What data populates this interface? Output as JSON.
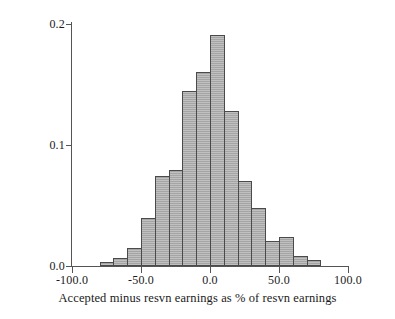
{
  "chart_data": {
    "type": "bar",
    "title": "",
    "subtitle": "",
    "xlabel": "Accepted minus resvn earnings as % of resvn earnings",
    "ylabel": "Fraction",
    "xlim": [
      -100.0,
      100.0
    ],
    "ylim": [
      0.0,
      0.2
    ],
    "grid": false,
    "legend": null,
    "bin_width": 10,
    "x_tick_labels": [
      "-100.0",
      "-50.0",
      "0.0",
      "50.0",
      "100.0"
    ],
    "x_tick_values": [
      -100.0,
      -50.0,
      0.0,
      50.0,
      100.0
    ],
    "y_tick_labels": [
      "0.0",
      "0.1",
      "0.2"
    ],
    "y_tick_values": [
      0.0,
      0.1,
      0.2
    ],
    "bar_fill_color": "#a5a5a5",
    "bar_edge_color": "#4a4a4a",
    "axis_color": "#555555",
    "background_color": "#ffffff",
    "bin_left_edges": [
      -80,
      -70,
      -60,
      -50,
      -40,
      -30,
      -20,
      -10,
      0,
      10,
      20,
      30,
      40,
      50,
      60,
      70
    ],
    "bin_centers": [
      -75,
      -65,
      -55,
      -45,
      -35,
      -25,
      -15,
      -5,
      5,
      15,
      25,
      35,
      45,
      55,
      65,
      75
    ],
    "categories": [
      "-80 to -70",
      "-70 to -60",
      "-60 to -50",
      "-50 to -40",
      "-40 to -30",
      "-30 to -20",
      "-20 to -10",
      "-10 to 0",
      "0 to 10",
      "10 to 20",
      "20 to 30",
      "30 to 40",
      "40 to 50",
      "50 to 60",
      "60 to 70",
      "70 to 80"
    ],
    "values": [
      0.003,
      0.007,
      0.015,
      0.04,
      0.074,
      0.079,
      0.145,
      0.16,
      0.191,
      0.128,
      0.07,
      0.048,
      0.021,
      0.024,
      0.008,
      0.005
    ]
  },
  "axes": {
    "y_title": "Fraction",
    "x_title": "Accepted minus resvn earnings as % of resvn earnings"
  }
}
